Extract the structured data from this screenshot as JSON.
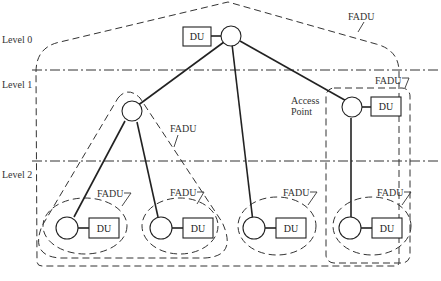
{
  "diagram": {
    "levels": [
      {
        "label": "Level 0"
      },
      {
        "label": "Level 1"
      },
      {
        "label": "Level 2"
      }
    ],
    "group_label": "FADU",
    "unit_label": "DU",
    "access_point": {
      "line1": "Access",
      "line2": "Point"
    },
    "fadu_labels": {
      "top": "FADU",
      "left_triangle": "FADU",
      "right_group": "FADU",
      "leaf1": "FADU",
      "leaf2": "FADU",
      "leaf3": "FADU",
      "leaf4": "FADU"
    },
    "du_labels": {
      "root": "DU",
      "access_point": "DU",
      "leaf1": "DU",
      "leaf2": "DU",
      "leaf3": "DU",
      "leaf4": "DU"
    }
  }
}
